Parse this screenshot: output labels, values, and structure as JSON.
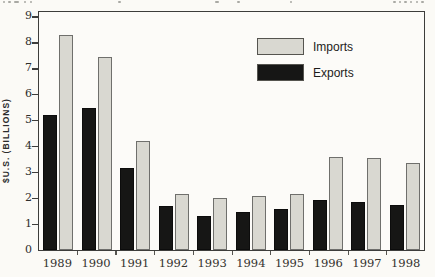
{
  "figure": {
    "y_axis_title": "$U.S. (BILLIONS)"
  },
  "chart_data": {
    "type": "bar",
    "title": "",
    "categories": [
      "1989",
      "1990",
      "1991",
      "1992",
      "1993",
      "1994",
      "1995",
      "1996",
      "1997",
      "1998"
    ],
    "series": [
      {
        "name": "Exports",
        "values": [
          5.2,
          5.5,
          3.15,
          1.7,
          1.3,
          1.45,
          1.6,
          1.95,
          1.85,
          1.75
        ]
      },
      {
        "name": "Imports",
        "values": [
          8.3,
          7.45,
          4.2,
          2.15,
          2.0,
          2.1,
          2.15,
          3.6,
          3.55,
          3.35
        ]
      }
    ],
    "xlabel": "",
    "ylabel": "$U.S. (BILLIONS)",
    "yticks": [
      0,
      1,
      2,
      3,
      4,
      5,
      6,
      7,
      8,
      9
    ],
    "ylim": [
      0,
      9.15
    ],
    "grid": false,
    "legend_position": "inside-upper-right",
    "legend_order": [
      "Imports",
      "Exports"
    ],
    "colors": {
      "exports_fill": "#161615",
      "imports_fill": "#d9d8d1",
      "imports_border": "#6f6f6c",
      "frame": "#3d3d3b",
      "paper": "#fbfaf6",
      "text": "#2e2e2c"
    }
  }
}
